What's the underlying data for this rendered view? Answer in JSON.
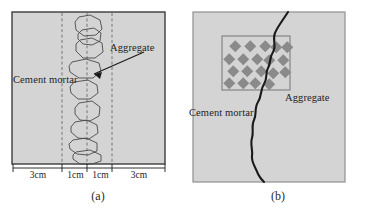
{
  "figure": {
    "background": "#ffffff",
    "specimen_fill": "#d4d4d4",
    "specimen_stroke": "#3c3c3c",
    "aggregate_fill": "#8a8a8a",
    "crack_color": "#1a1a1a",
    "dashed_color": "#6b6b6b"
  },
  "panel_a": {
    "caption": "(a)",
    "label_mortar": "Cement mortar",
    "label_aggregate": "Aggregate",
    "dimensions": [
      "3cm",
      "1cm",
      "1cm",
      "3cm"
    ],
    "aggregate_count": 9,
    "dashed_line_count": 3
  },
  "panel_b": {
    "caption": "(b)",
    "label_mortar": "Cement mortar",
    "label_aggregate": "Aggregate",
    "aggregate_rows": 4,
    "aggregate_shape": "diamond"
  }
}
